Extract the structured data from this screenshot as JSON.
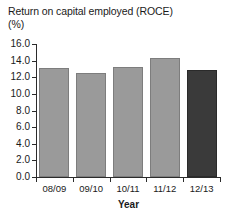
{
  "chart_data": {
    "type": "bar",
    "title": "Return on capital employed (ROCE)",
    "subtitle": "(%)",
    "xlabel": "Year",
    "ylabel": "",
    "categories": [
      "08/09",
      "09/10",
      "10/11",
      "11/12",
      "12/13"
    ],
    "values": [
      13.1,
      12.5,
      13.2,
      14.3,
      12.9
    ],
    "ylim": [
      0.0,
      16.0
    ],
    "ytick_labels": [
      "0.0",
      "2.0",
      "4.0",
      "6.0",
      "8.0",
      "10.0",
      "12.0",
      "14.0",
      "16.0"
    ],
    "ytick_values": [
      0.0,
      2.0,
      4.0,
      6.0,
      8.0,
      10.0,
      12.0,
      14.0,
      16.0
    ],
    "grid": false,
    "legend": null,
    "bar_colors": [
      "#9a9a9a",
      "#9a9a9a",
      "#9a9a9a",
      "#9a9a9a",
      "#3a3a3a"
    ],
    "highlight_index": 4,
    "colors": {
      "bar_light": "#9a9a9a",
      "bar_dark": "#3a3a3a",
      "axis": "#2b2b2b",
      "text": "#1a1a1a",
      "background": "#ffffff"
    }
  }
}
